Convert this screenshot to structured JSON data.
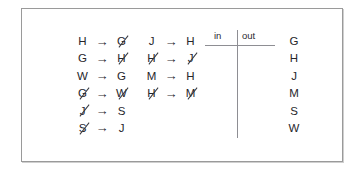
{
  "worksheet": {
    "mapping_columns": [
      {
        "name": "mapping-col-1",
        "rows": [
          {
            "from": "H",
            "from_struck": false,
            "arrow": "→",
            "to": "G",
            "to_struck": true
          },
          {
            "from": "G",
            "from_struck": false,
            "arrow": "→",
            "to": "H",
            "to_struck": true
          },
          {
            "from": "W",
            "from_struck": false,
            "arrow": "→",
            "to": "G",
            "to_struck": false
          },
          {
            "from": "G",
            "from_struck": true,
            "arrow": "→",
            "to": "W",
            "to_struck": true
          },
          {
            "from": "J",
            "from_struck": true,
            "arrow": "→",
            "to": "S",
            "to_struck": false
          },
          {
            "from": "S",
            "from_struck": true,
            "arrow": "→",
            "to": "J",
            "to_struck": false
          }
        ]
      },
      {
        "name": "mapping-col-2",
        "rows": [
          {
            "from": "J",
            "from_struck": false,
            "arrow": "→",
            "to": "H",
            "to_struck": false
          },
          {
            "from": "H",
            "from_struck": true,
            "arrow": "→",
            "to": "J",
            "to_struck": true
          },
          {
            "from": "M",
            "from_struck": false,
            "arrow": "→",
            "to": "H",
            "to_struck": false
          },
          {
            "from": "H",
            "from_struck": true,
            "arrow": "→",
            "to": "M",
            "to_struck": true
          }
        ]
      }
    ],
    "io_table": {
      "in_label": "in",
      "out_label": "out",
      "in_values": [],
      "out_values": []
    },
    "letter_list": [
      "G",
      "H",
      "J",
      "M",
      "S",
      "W"
    ]
  },
  "colors": {
    "ink": "#26262b",
    "rule": "#8e8e93",
    "frame": "#9a9a9a",
    "background": "#ffffff"
  }
}
